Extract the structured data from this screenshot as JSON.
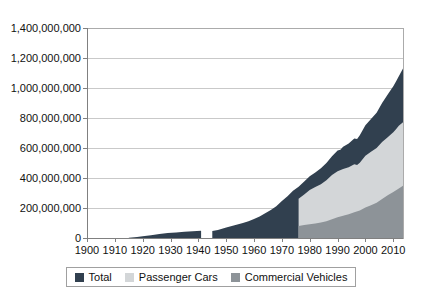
{
  "chart_data": {
    "type": "area",
    "mode": "overlapping",
    "title": "",
    "xlabel": "",
    "ylabel": "",
    "grid": true,
    "legend_position": "bottom-center",
    "x_range": [
      1900,
      2013.5
    ],
    "ylim_millions": [
      0,
      1400
    ],
    "y_ticks": [
      {
        "value_millions": 1400,
        "label": "1,400,000,000"
      },
      {
        "value_millions": 1200,
        "label": "1,200,000,000"
      },
      {
        "value_millions": 1000,
        "label": "1,000,000,000"
      },
      {
        "value_millions": 800,
        "label": "800,000,000"
      },
      {
        "value_millions": 600,
        "label": "600,000,000"
      },
      {
        "value_millions": 400,
        "label": "400,000,000"
      },
      {
        "value_millions": 200,
        "label": "200,000,000"
      },
      {
        "value_millions": 0,
        "label": "0"
      }
    ],
    "x_ticks": [
      "1900",
      "1910",
      "1920",
      "1930",
      "1940",
      "1950",
      "1960",
      "1970",
      "1980",
      "1990",
      "2000",
      "2010"
    ],
    "series": [
      {
        "name": "Total",
        "color": "#31404f",
        "gap_years": [
          1941,
          1945
        ],
        "segments_points_millions": [
          [
            [
              1915,
              2
            ],
            [
              1918,
              6
            ],
            [
              1920,
              11
            ],
            [
              1923,
              18
            ],
            [
              1926,
              27
            ],
            [
              1929,
              34
            ],
            [
              1932,
              37
            ],
            [
              1935,
              41
            ],
            [
              1938,
              45
            ],
            [
              1941,
              49
            ]
          ],
          [
            [
              1945,
              47
            ],
            [
              1947,
              53
            ],
            [
              1950,
              70
            ],
            [
              1953,
              85
            ],
            [
              1956,
              100
            ],
            [
              1958,
              112
            ],
            [
              1960,
              127
            ],
            [
              1962,
              143
            ],
            [
              1964,
              165
            ],
            [
              1966,
              187
            ],
            [
              1968,
              212
            ],
            [
              1970,
              246
            ],
            [
              1972,
              278
            ],
            [
              1974,
              315
            ],
            [
              1976,
              342
            ],
            [
              1978,
              376
            ],
            [
              1980,
              411
            ],
            [
              1982,
              437
            ],
            [
              1984,
              465
            ],
            [
              1986,
              500
            ],
            [
              1988,
              545
            ],
            [
              1990,
              583
            ],
            [
              1991,
              588
            ],
            [
              1992,
              608
            ],
            [
              1994,
              630
            ],
            [
              1996,
              663
            ],
            [
              1997,
              660
            ],
            [
              1998,
              685
            ],
            [
              2000,
              751
            ],
            [
              2002,
              793
            ],
            [
              2004,
              835
            ],
            [
              2006,
              900
            ],
            [
              2008,
              957
            ],
            [
              2010,
              1012
            ],
            [
              2011,
              1043
            ],
            [
              2012,
              1078
            ],
            [
              2013.5,
              1130
            ]
          ]
        ]
      },
      {
        "name": "Passenger Cars",
        "color": "#d3d6d8",
        "segments_points_millions": [
          [
            [
              1976,
              262
            ],
            [
              1978,
              290
            ],
            [
              1980,
              320
            ],
            [
              1982,
              340
            ],
            [
              1984,
              358
            ],
            [
              1986,
              385
            ],
            [
              1988,
              420
            ],
            [
              1990,
              445
            ],
            [
              1992,
              460
            ],
            [
              1994,
              472
            ],
            [
              1996,
              492
            ],
            [
              1997,
              487
            ],
            [
              1998,
              502
            ],
            [
              2000,
              548
            ],
            [
              2002,
              575
            ],
            [
              2004,
              600
            ],
            [
              2006,
              640
            ],
            [
              2008,
              672
            ],
            [
              2010,
              705
            ],
            [
              2011,
              725
            ],
            [
              2012,
              748
            ],
            [
              2013.5,
              772
            ]
          ]
        ]
      },
      {
        "name": "Commercial Vehicles",
        "color": "#8d9398",
        "segments_points_millions": [
          [
            [
              1976,
              80
            ],
            [
              1978,
              86
            ],
            [
              1980,
              91
            ],
            [
              1982,
              97
            ],
            [
              1984,
              103
            ],
            [
              1986,
              112
            ],
            [
              1988,
              125
            ],
            [
              1990,
              138
            ],
            [
              1992,
              148
            ],
            [
              1994,
              158
            ],
            [
              1996,
              171
            ],
            [
              1998,
              183
            ],
            [
              2000,
              203
            ],
            [
              2002,
              218
            ],
            [
              2004,
              235
            ],
            [
              2006,
              260
            ],
            [
              2008,
              285
            ],
            [
              2010,
              307
            ],
            [
              2012,
              330
            ],
            [
              2013.5,
              348
            ]
          ]
        ]
      }
    ]
  },
  "style": {
    "background": "#ffffff",
    "grid_color": "#c9c9c9",
    "axis_color": "#808080",
    "plot_border_color": "#ababab",
    "text_color": "#111111",
    "legend_border_color": "#a0a0a0"
  }
}
